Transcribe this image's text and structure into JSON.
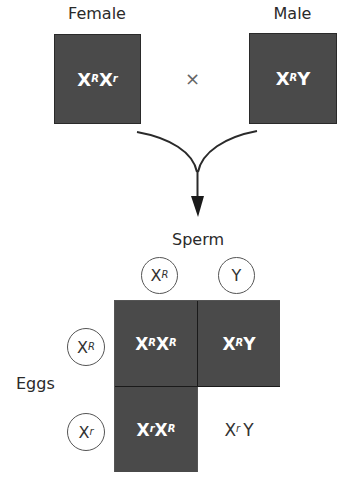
{
  "parents": {
    "female": {
      "label": "Female",
      "genotype_base1": "X",
      "genotype_sup1": "R",
      "genotype_base2": "X",
      "genotype_sup2": "r"
    },
    "male": {
      "label": "Male",
      "genotype_base1": "X",
      "genotype_sup1": "R",
      "genotype_base2": "Y",
      "genotype_sup2": ""
    },
    "cross_symbol": "×"
  },
  "sperm": {
    "label": "Sperm",
    "gametes": [
      {
        "base": "X",
        "sup": "R"
      },
      {
        "base": "Y",
        "sup": ""
      }
    ]
  },
  "eggs": {
    "label": "Eggs",
    "gametes": [
      {
        "base": "X",
        "sup": "R"
      },
      {
        "base": "X",
        "sup": "r"
      }
    ]
  },
  "punnett": {
    "cells": [
      {
        "b1": "X",
        "s1": "R",
        "b2": "X",
        "s2": "R",
        "shaded": true
      },
      {
        "b1": "X",
        "s1": "R",
        "b2": "Y",
        "s2": "",
        "shaded": true
      },
      {
        "b1": "X",
        "s1": "r",
        "b2": "X",
        "s2": "R",
        "shaded": true
      },
      {
        "b1": "X",
        "s1": "r",
        "b2": "Y",
        "s2": "",
        "shaded": false
      }
    ]
  },
  "colors": {
    "shaded": "#4a4a4a",
    "unshaded": "#ffffff",
    "line": "#2a2a2a"
  }
}
